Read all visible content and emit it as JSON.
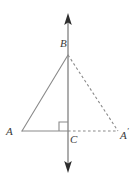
{
  "figure": {
    "width": 137,
    "height": 178,
    "background_color": "#ffffff",
    "line_color": "#888888",
    "label_color": "#3a3a3a",
    "labels": {
      "b": "B",
      "a": "A",
      "c": "C",
      "a_prime_base": "A",
      "a_prime_mark": "′"
    },
    "points": {
      "B": {
        "x": 68,
        "y": 55
      },
      "A": {
        "x": 22,
        "y": 131
      },
      "C": {
        "x": 68,
        "y": 131
      },
      "A_prime": {
        "x": 118,
        "y": 131
      }
    },
    "axis_line": {
      "name": "vertical-mirror-line",
      "x": 68,
      "y_top": 14,
      "y_bottom": 172,
      "arrows": "both"
    },
    "segments": [
      {
        "name": "segment-AB",
        "from": "A",
        "to": "B",
        "style": "solid"
      },
      {
        "name": "segment-AC",
        "from": "A",
        "to": "C",
        "style": "solid"
      },
      {
        "name": "segment-BA-prime",
        "from": "B",
        "to": "A_prime",
        "style": "dashed"
      },
      {
        "name": "segment-CA-prime",
        "from": "C",
        "to": "A_prime",
        "style": "dashed"
      }
    ],
    "right_angle_marker": {
      "name": "right-angle-at-C",
      "at": "C",
      "size": 9,
      "orientation": "upper-left"
    }
  }
}
